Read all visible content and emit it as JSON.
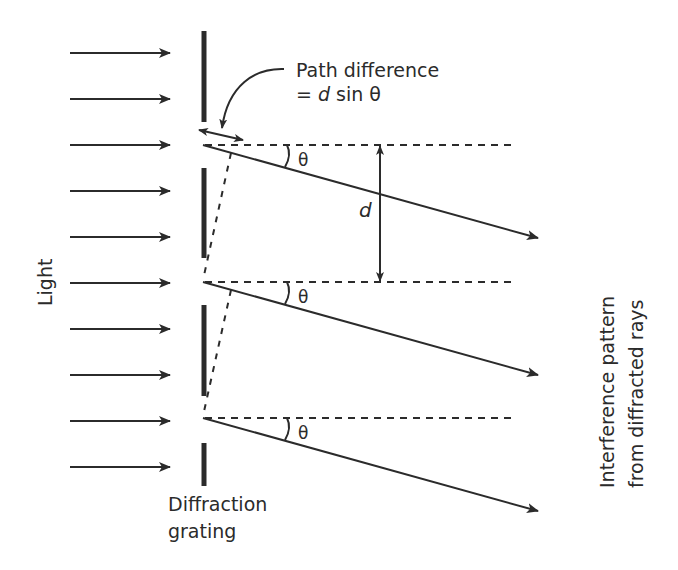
{
  "diagram": {
    "labels": {
      "light": "Light",
      "grating_line1": "Diffraction",
      "grating_line2": "grating",
      "path_diff_line1": "Path difference",
      "path_diff_eq_prefix": "= ",
      "path_diff_d": "d",
      "path_diff_suffix": " sin θ",
      "spacing": "d",
      "theta": "θ",
      "interference_line1": "Interference pattern",
      "interference_line2": "from diffracted rays"
    },
    "colors": {
      "ink": "#2b2b2b",
      "background": "#ffffff"
    },
    "incident_rays": {
      "count": 10,
      "x_start": 70,
      "x_end": 170,
      "y_positions": [
        53,
        99,
        145,
        191,
        237,
        283,
        329,
        375,
        421,
        467
      ]
    },
    "grating_segments": [
      {
        "y1": 31,
        "y2": 122
      },
      {
        "y1": 168,
        "y2": 258
      },
      {
        "y1": 305,
        "y2": 396
      },
      {
        "y1": 443,
        "y2": 486
      }
    ],
    "slits_y": [
      145,
      282,
      418
    ],
    "diffracted_rays": [
      {
        "x1": 203,
        "y1": 145,
        "x2": 538,
        "y2": 238
      },
      {
        "x1": 203,
        "y1": 282,
        "x2": 538,
        "y2": 375
      },
      {
        "x1": 203,
        "y1": 418,
        "x2": 538,
        "y2": 511
      }
    ]
  }
}
